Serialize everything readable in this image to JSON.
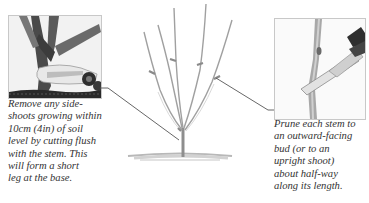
{
  "figure": {
    "left_callout": {
      "photo_description": "Secateurs cutting a side-shoot flush with the main stem near soil level",
      "caption_lines": [
        "Remove any side-",
        "shoots growing within",
        "10cm (4in) of soil",
        "level by cutting flush",
        "with the stem. This",
        "will form a short",
        "leg at the base."
      ]
    },
    "right_callout": {
      "photo_description": "Secateurs pruning a stem just above an outward-facing bud",
      "caption_lines": [
        "Prune each stem to",
        "an outward-facing",
        "bud (or to an",
        "upright shoot)",
        "about half-way",
        "along its length."
      ]
    },
    "center_illustration": {
      "description": "Pencil sketch of a young bush with five stems, cut marks half-way up each stem, and a short leg above the soil line",
      "cut_marks": 5
    },
    "colors": {
      "caption_text": "#333333",
      "leader_line": "#555555",
      "cut_mark": "#8a8a8a",
      "sketch": "#9a9a9a"
    }
  }
}
